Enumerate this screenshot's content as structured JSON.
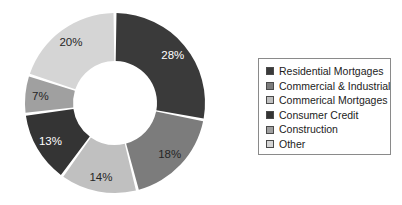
{
  "chart_data": {
    "type": "pie",
    "variant": "donut",
    "title": "",
    "subtitle": "",
    "xlabel": "",
    "ylabel": "",
    "grid": false,
    "legend_position": "right",
    "start_angle_deg": 0,
    "direction": "clockwise",
    "categories": [
      "Residential Mortgages",
      "Commercial & Industrial",
      "Commerical Mortgages",
      "Consumer Credit",
      "Construction",
      "Other"
    ],
    "values": [
      28,
      18,
      14,
      13,
      7,
      20
    ],
    "value_unit": "%",
    "data_labels": [
      "28%",
      "18%",
      "14%",
      "13%",
      "7%",
      "20%"
    ],
    "colors": [
      "#3a3a3a",
      "#7c7c7c",
      "#c0c0c0",
      "#343434",
      "#a0a0a0",
      "#d5d5d5"
    ],
    "label_colors": [
      "light",
      "dark",
      "dark",
      "light",
      "dark",
      "dark"
    ],
    "slice_gap_color": "#ffffff",
    "center_hole_color": "#ffffff"
  },
  "legend": {
    "border_color": "#8a8a8a",
    "items": [
      {
        "label": "Residential Mortgages",
        "color": "#3a3a3a"
      },
      {
        "label": "Commercial & Industrial",
        "color": "#7c7c7c"
      },
      {
        "label": "Commerical Mortgages",
        "color": "#c0c0c0"
      },
      {
        "label": "Consumer Credit",
        "color": "#343434"
      },
      {
        "label": "Construction",
        "color": "#a0a0a0"
      },
      {
        "label": "Other",
        "color": "#d5d5d5"
      }
    ]
  }
}
